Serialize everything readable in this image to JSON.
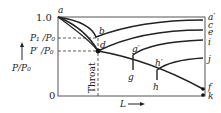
{
  "diagram": {
    "y_axis": {
      "label": "P/P₀",
      "ticks": {
        "top": "1.0",
        "bottom": "0",
        "p1": "P₁ /P₀",
        "pprime": "P′ /P₀"
      }
    },
    "x_axis": {
      "label": "L"
    },
    "throat_label": "Throat",
    "point_labels": {
      "a": "a",
      "b": "b",
      "d": "d",
      "g_prime": "g′",
      "g": "g",
      "h_prime": "h′",
      "h": "h",
      "a_prime": "a′",
      "c": "c",
      "e": "e",
      "i": "i",
      "j": "j",
      "f": "f",
      "k": "k"
    }
  }
}
